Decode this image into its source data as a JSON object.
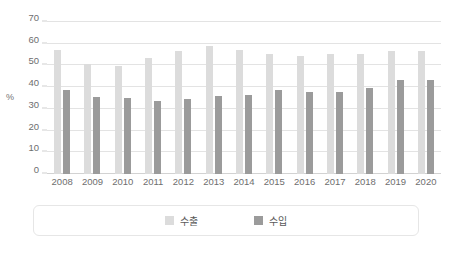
{
  "chart_data": {
    "type": "bar",
    "title": "",
    "subtitle": "",
    "xlabel": "",
    "ylabel": "%",
    "ylim": [
      0,
      70
    ],
    "ytick_step": 10,
    "yticks": [
      0,
      10,
      20,
      30,
      40,
      50,
      60,
      70
    ],
    "grid": true,
    "legend_position": "bottom",
    "categories": [
      "2008",
      "2009",
      "2010",
      "2011",
      "2012",
      "2013",
      "2014",
      "2015",
      "2016",
      "2017",
      "2018",
      "2019",
      "2020"
    ],
    "series": [
      {
        "name": "수출",
        "color": "#dcdcdc",
        "values": [
          57.0,
          50.8,
          49.7,
          53.5,
          56.5,
          59.0,
          57.3,
          55.5,
          54.4,
          55.4,
          55.4,
          56.5,
          56.5
        ]
      },
      {
        "name": "수입",
        "color": "#9b9b9b",
        "values": [
          38.7,
          35.3,
          35.2,
          33.8,
          34.6,
          35.8,
          36.4,
          38.7,
          37.9,
          37.9,
          39.8,
          43.2,
          43.3
        ]
      }
    ]
  },
  "colors": {
    "export": "#dcdcdc",
    "import": "#9b9b9b",
    "gridline": "#e3e3e3",
    "axis_text": "#6e6e6e",
    "legend_border": "#e6e6e6",
    "background": "#ffffff"
  },
  "legend": {
    "items": [
      {
        "label": "수출",
        "color": "#dcdcdc"
      },
      {
        "label": "수입",
        "color": "#9b9b9b"
      }
    ]
  }
}
